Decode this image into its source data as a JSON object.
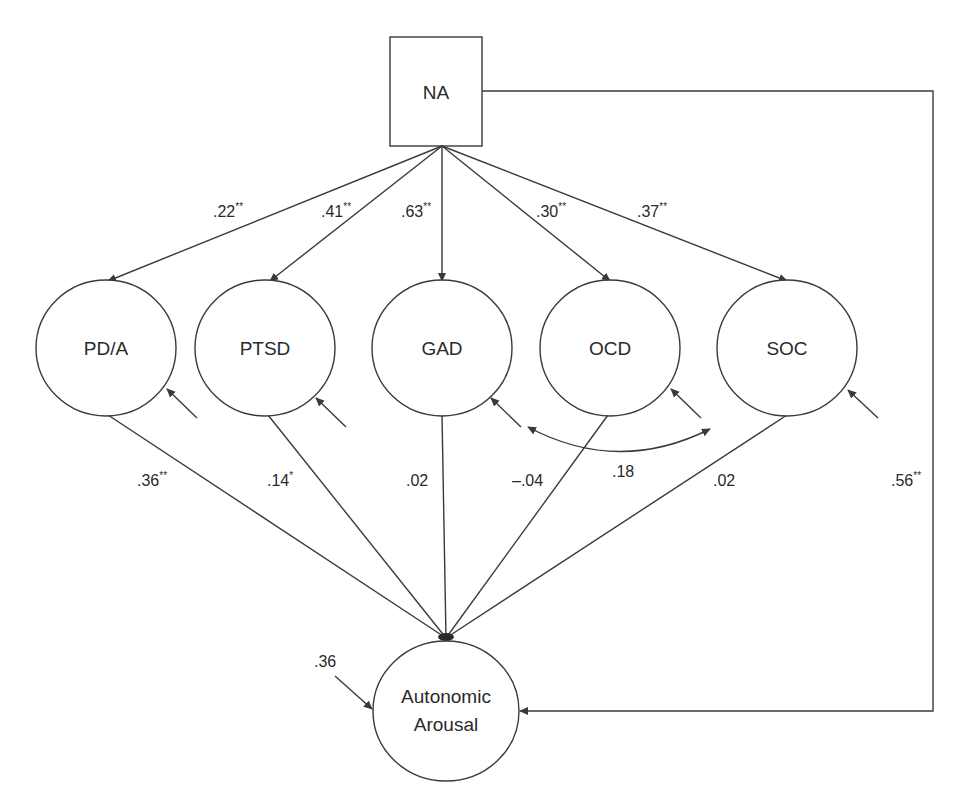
{
  "diagram": {
    "type": "structural-equation-path-diagram",
    "colors": {
      "line": "#3a3a3a",
      "text": "#2a2a2a",
      "background": "#ffffff"
    },
    "nodes": {
      "na": {
        "label": "NA",
        "shape": "rectangle"
      },
      "pda": {
        "label": "PD/A",
        "shape": "ellipse"
      },
      "ptsd": {
        "label": "PTSD",
        "shape": "ellipse"
      },
      "gad": {
        "label": "GAD",
        "shape": "ellipse"
      },
      "ocd": {
        "label": "OCD",
        "shape": "ellipse"
      },
      "soc": {
        "label": "SOC",
        "shape": "ellipse"
      },
      "arousal": {
        "label_line1": "Autonomic",
        "label_line2": "Arousal",
        "shape": "ellipse"
      }
    },
    "paths_from_na": [
      {
        "to": "PD/A",
        "coef": ".22",
        "sig": "**"
      },
      {
        "to": "PTSD",
        "coef": ".41",
        "sig": "**"
      },
      {
        "to": "GAD",
        "coef": ".63",
        "sig": "**"
      },
      {
        "to": "OCD",
        "coef": ".30",
        "sig": "**"
      },
      {
        "to": "SOC",
        "coef": ".37",
        "sig": "**"
      }
    ],
    "paths_to_arousal": [
      {
        "from": "PD/A",
        "coef": ".36",
        "sig": "**"
      },
      {
        "from": "PTSD",
        "coef": ".14",
        "sig": "*"
      },
      {
        "from": "GAD",
        "coef": ".02",
        "sig": ""
      },
      {
        "from": "OCD",
        "coef": "–.04",
        "sig": ""
      },
      {
        "from": "SOC",
        "coef": ".02",
        "sig": ""
      }
    ],
    "direct_path": {
      "from": "NA",
      "to": "Autonomic Arousal",
      "coef": ".56",
      "sig": "**"
    },
    "covariance": {
      "between": [
        "GAD",
        "OCD"
      ],
      "coef": ".18"
    },
    "arousal_residual": {
      "value": ".36"
    }
  }
}
